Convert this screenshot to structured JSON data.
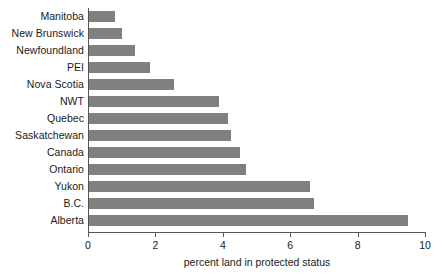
{
  "chart_data": {
    "type": "bar",
    "orientation": "horizontal",
    "title": "",
    "xlabel": "percent land in protected status",
    "ylabel": "",
    "xlim": [
      0,
      10
    ],
    "xticks": [
      0,
      2,
      4,
      6,
      8,
      10
    ],
    "xtick_labels": [
      "0",
      "2",
      "4",
      "6",
      "8",
      "10"
    ],
    "grid": false,
    "legend": null,
    "bar_color": "#808080",
    "axis_color": "#555555",
    "background_color": "#ffffff",
    "categories": [
      "Manitoba",
      "New Brunswick",
      "Newfoundland",
      "PEI",
      "Nova Scotia",
      "NWT",
      "Quebec",
      "Saskatchewan",
      "Canada",
      "Ontario",
      "Yukon",
      "B.C.",
      "Alberta"
    ],
    "values": [
      0.8,
      1.0,
      1.4,
      1.85,
      2.55,
      3.9,
      4.15,
      4.25,
      4.5,
      4.7,
      6.6,
      6.7,
      9.5
    ]
  }
}
